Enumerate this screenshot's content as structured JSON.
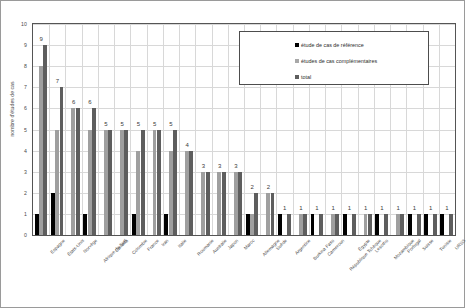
{
  "chart_data": {
    "type": "bar",
    "title": "",
    "xlabel": "",
    "ylabel": "nombre d'études de cas",
    "ylim": [
      0,
      10
    ],
    "ytick_step": 1,
    "yticks": [
      "0",
      "1",
      "2",
      "3",
      "4",
      "5",
      "6",
      "7",
      "8",
      "9",
      "10"
    ],
    "grid": true,
    "legend_position": "top-right-inside",
    "categories": [
      "Espagne",
      "États-Unis",
      "Norvège",
      "Afrique du Sud",
      "Canada",
      "Colombie",
      "France",
      "Iran",
      "Italie",
      "Roumanie",
      "Australie",
      "Japon",
      "Maroc",
      "Allemagne",
      "Suède",
      "Argentine",
      "Burkina Faso",
      "Cameroun",
      "République Tchèque",
      "Égypte",
      "Lesotho",
      "Mozambique",
      "Portugal",
      "Suisse",
      "Tunisie",
      "URSS"
    ],
    "series": [
      {
        "name": "étude de cas de référence",
        "color": "#000000",
        "values": [
          1,
          2,
          0,
          1,
          0,
          0,
          1,
          0,
          1,
          0,
          0,
          0,
          0,
          1,
          0,
          1,
          0,
          1,
          0,
          1,
          0,
          1,
          0,
          1,
          1,
          1
        ]
      },
      {
        "name": "études de cas complémentaires",
        "color": "#9f9f9f",
        "values": [
          8,
          5,
          6,
          5,
          5,
          5,
          4,
          5,
          4,
          4,
          3,
          3,
          3,
          1,
          2,
          0,
          1,
          0,
          1,
          0,
          1,
          0,
          1,
          0,
          0,
          0
        ]
      },
      {
        "name": "total",
        "color": "#5e5e5e",
        "values": [
          9,
          7,
          6,
          6,
          5,
          5,
          5,
          5,
          5,
          4,
          3,
          3,
          3,
          2,
          2,
          1,
          1,
          1,
          1,
          1,
          1,
          1,
          1,
          1,
          1,
          1
        ]
      }
    ],
    "data_labels": [
      "9",
      "7",
      "6",
      "6",
      "5",
      "5",
      "5",
      "5",
      "5",
      "4",
      "3",
      "3",
      "3",
      "2",
      "2",
      "1",
      "1",
      "1",
      "1",
      "1",
      "1",
      "1",
      "1",
      "1",
      "1",
      "1"
    ]
  },
  "legend": {
    "items": [
      {
        "label": "étude de cas de référence"
      },
      {
        "label": "études de cas complémentaires"
      },
      {
        "label": "total"
      }
    ]
  }
}
